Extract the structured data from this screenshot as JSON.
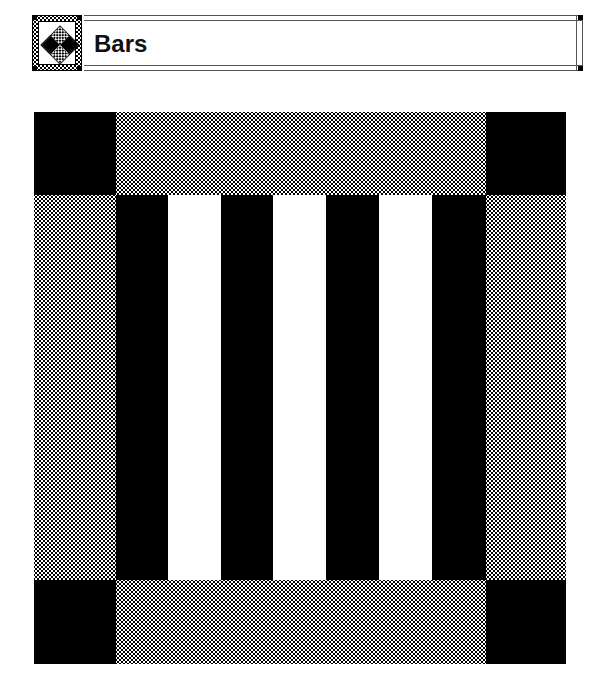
{
  "header": {
    "title": "Bars",
    "icon": "quilt-diamond-icon"
  },
  "quilt": {
    "colors": {
      "dark": "#000000",
      "light": "#ffffff",
      "pattern": "dotted-gray"
    },
    "corners": [
      "black",
      "black",
      "black",
      "black"
    ],
    "borders": [
      "dotted",
      "dotted",
      "dotted",
      "dotted"
    ],
    "center_bars": [
      "black",
      "white",
      "black",
      "white",
      "black",
      "white",
      "black"
    ]
  }
}
